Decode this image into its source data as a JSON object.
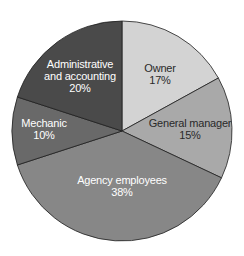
{
  "chart_data": {
    "type": "pie",
    "title": "",
    "start_angle_deg": 0,
    "direction": "clockwise",
    "center": [
      122,
      131
    ],
    "radius": 110,
    "slices": [
      {
        "label": "Owner",
        "value": 17,
        "display": "17%",
        "color": "#d3d3d3",
        "text_color": "#2a2a2a",
        "label_lines": [
          "Owner",
          "17%"
        ],
        "label_pos": [
          160,
          72
        ]
      },
      {
        "label": "General manager",
        "value": 15,
        "display": "15%",
        "color": "#a9a9a9",
        "text_color": "#2a2a2a",
        "label_lines": [
          "General manager",
          "15%"
        ],
        "label_pos": [
          190,
          127
        ]
      },
      {
        "label": "Agency employees",
        "value": 38,
        "display": "38%",
        "color": "#878787",
        "text_color": "#ffffff",
        "label_lines": [
          "Agency employees",
          "38%"
        ],
        "label_pos": [
          122,
          184
        ]
      },
      {
        "label": "Mechanic",
        "value": 10,
        "display": "10%",
        "color": "#696969",
        "text_color": "#ffffff",
        "label_lines": [
          "Mechanic",
          "10%"
        ],
        "label_pos": [
          44,
          127
        ]
      },
      {
        "label": "Administrative and accounting",
        "value": 20,
        "display": "20%",
        "color": "#4a4a4a",
        "text_color": "#ffffff",
        "label_lines": [
          "Administrative",
          "and accounting",
          "20%"
        ],
        "label_pos": [
          80,
          68
        ]
      }
    ],
    "legend": null,
    "stroke_color": "#1e1e1e"
  }
}
